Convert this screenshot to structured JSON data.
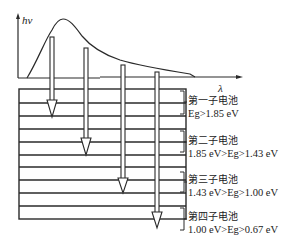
{
  "axes": {
    "y_label": "hν",
    "x_label": "λ"
  },
  "cells": [
    {
      "name": "第一子电池",
      "condition": "Eg>1.85 eV"
    },
    {
      "name": "第二子电池",
      "condition": "1.85 eV>Eg>1.43 eV"
    },
    {
      "name": "第三子电池",
      "condition": "1.43 eV>Eg>1.00 eV"
    },
    {
      "name": "第四子电池",
      "condition": "1.00 eV>Eg>0.67 eV"
    }
  ],
  "colors": {
    "line": "#2a2a2a",
    "background": "#ffffff"
  }
}
